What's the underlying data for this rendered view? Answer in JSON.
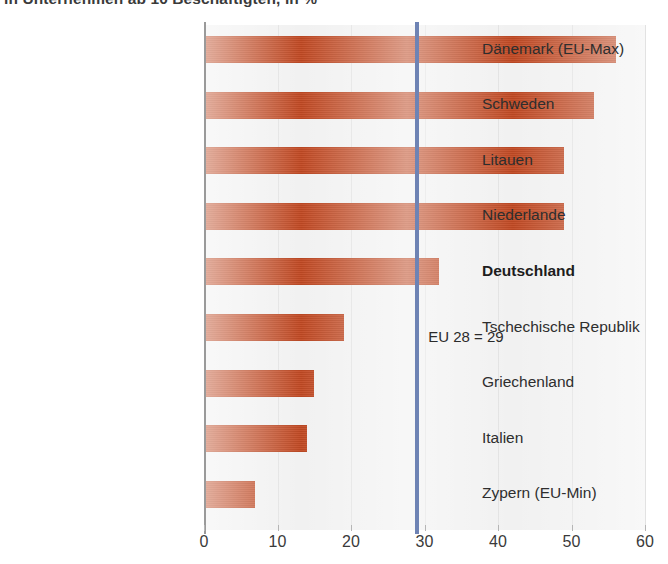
{
  "subtitle": "in Unternehmen ab 10 Beschäftigten, in %",
  "chart_data": {
    "type": "bar",
    "orientation": "horizontal",
    "title": "",
    "subtitle": "in Unternehmen ab 10 Beschäftigten, in %",
    "xlabel": "",
    "ylabel": "",
    "xlim": [
      0,
      60
    ],
    "xticks": [
      0,
      10,
      20,
      30,
      40,
      50,
      60
    ],
    "grid": true,
    "grid_axis": "x",
    "legend": false,
    "bar_color": "#c24a24",
    "reference_line": {
      "label": "EU 28 = 29",
      "value": 29,
      "color": "#6e83b4"
    },
    "highlight_category": "Deutschland",
    "categories": [
      "Dänemark (EU-Max)",
      "Schweden",
      "Litauen",
      "Niederlande",
      "Deutschland",
      "Tschechische Republik",
      "Griechenland",
      "Italien",
      "Zypern (EU-Min)"
    ],
    "values": [
      56,
      53,
      49,
      49,
      32,
      19,
      15,
      14,
      7
    ]
  }
}
